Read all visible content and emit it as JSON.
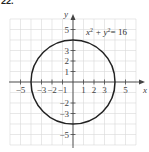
{
  "problem_number": "22.",
  "chart_data": {
    "type": "line",
    "title": "",
    "equation": "x² + y² = 16",
    "equation_parts": {
      "x": "x",
      "sup1": "2",
      "plus": "+ y",
      "sup2": "2",
      "eq": "= 16"
    },
    "xlabel": "x",
    "ylabel": "y",
    "xlim": [
      -6,
      6
    ],
    "ylim": [
      -6,
      6
    ],
    "grid": true,
    "x_ticks": [
      "−5",
      "−3",
      "−2",
      "−1",
      "1",
      "2",
      "3",
      "5"
    ],
    "y_ticks": [
      "5",
      "3",
      "2",
      "1",
      "−2",
      "−3",
      "−5"
    ],
    "series": [
      {
        "name": "circle",
        "center": [
          0,
          0
        ],
        "radius": 4
      }
    ]
  }
}
